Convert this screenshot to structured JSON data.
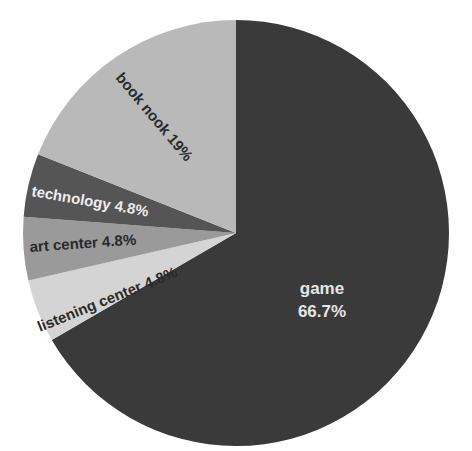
{
  "chart_data": {
    "type": "pie",
    "title": "",
    "start_angle_deg": 0,
    "direction": "clockwise",
    "slices": [
      {
        "label": "game",
        "value": 66.7,
        "display": "66.7%",
        "color": "#3a3a3a",
        "text_color": "#e6e6e6"
      },
      {
        "label": "listening center",
        "value": 4.8,
        "display": "4.8%",
        "color": "#d4d4d4",
        "text_color": "#2a2a2a"
      },
      {
        "label": "art center",
        "value": 4.8,
        "display": "4.8%",
        "color": "#9a9a9a",
        "text_color": "#2a2a2a"
      },
      {
        "label": "technology",
        "value": 4.8,
        "display": "4.8%",
        "color": "#555555",
        "text_color": "#eeeeee"
      },
      {
        "label": "book nook",
        "value": 19,
        "display": "19%",
        "color": "#b9b9b9",
        "text_color": "#2a2a2a"
      }
    ],
    "legend": "none"
  },
  "labels": {
    "game_name": "game",
    "game_pct": "66.7%",
    "listening": "listening center 4.8%",
    "art": "art center 4.8%",
    "technology": "technology 4.8%",
    "book": "book nook 19%"
  }
}
